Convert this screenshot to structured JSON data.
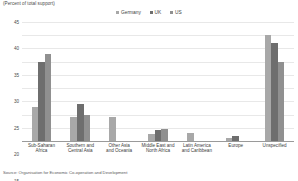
{
  "chart_data": {
    "type": "bar",
    "title": "",
    "subtitle": "",
    "axis_note": "(Percent of total support)",
    "xlabel": "",
    "ylabel": "",
    "ylim": [
      0,
      45
    ],
    "ytick_step": 5,
    "yticks": [
      "45",
      "40",
      "35",
      "30",
      "25",
      "20",
      "15",
      "10",
      "5",
      "0"
    ],
    "grid": true,
    "legend_position": "top-center",
    "categories": [
      "Sub-Saharan Africa",
      "Southern and Central Asia",
      "Other Asia and Oceania",
      "Middle East and North Africa",
      "Latin America and Caribbean",
      "Europe",
      "Unspecified"
    ],
    "category_lines": [
      [
        "Sub-Saharan",
        "Africa"
      ],
      [
        "Southern and",
        "Central Asia"
      ],
      [
        "Other Asia",
        "and Oceania"
      ],
      [
        "Middle East and",
        "North Africa"
      ],
      [
        "Latin America",
        "and Caribbean"
      ],
      [
        "Europe"
      ],
      [
        "Unspecified"
      ]
    ],
    "series": [
      {
        "name": "Germany",
        "color": "#a8a8a8",
        "values": [
          13,
          9,
          9,
          2.5,
          3,
          1,
          40
        ]
      },
      {
        "name": "UK",
        "color": "#6e6e6e",
        "values": [
          30,
          14,
          0,
          4,
          0,
          2,
          37
        ]
      },
      {
        "name": "US",
        "color": "#909090",
        "values": [
          33,
          10,
          0,
          4.5,
          0,
          0,
          30
        ]
      }
    ],
    "source": "Source: Organisation for Economic Co-operation and Development"
  }
}
